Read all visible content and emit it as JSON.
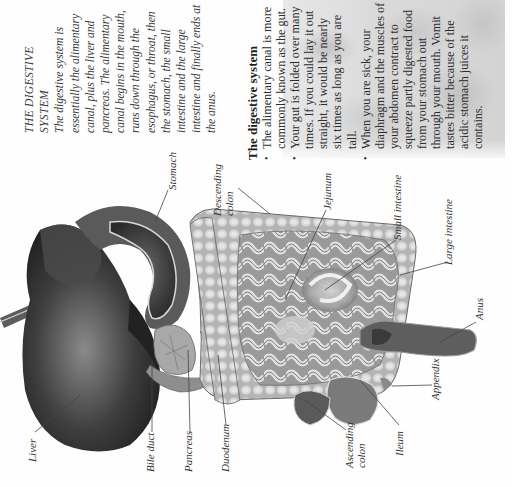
{
  "page": {
    "orientation": "rotated -90deg (text reads bottom-to-top)",
    "intro": {
      "title_line1": "THE DIGESTIVE",
      "title_line2": "SYSTEM",
      "body": "The digestive system is essentially the alimentary canal, plus the liver and pancreas. The alimentary canal begins in the mouth, runs down through the esophagus, or throat, then the stomach, the small intestine and the large intestine and finally ends at the anus."
    },
    "facts_box": {
      "heading": "The digestive system",
      "bullets": [
        "The alimentary canal is more commonly known as the gut.",
        "Your gut is folded over many times. If you could lay it out straight, it would be nearly six times as long as you are tall.",
        "When you are sick, your diaphragm and the muscles of your abdomen contract to squeeze partly digested food from your stomach out through your mouth. Vomit tastes bitter because of the acidic stomach juices it contains."
      ]
    },
    "illustration": {
      "subject": "digestive-system-anatomy",
      "labels": {
        "liver": "Liver",
        "bile_duct": "Bile duct",
        "pancreas": "Pancreas",
        "duodenum": "Duodenum",
        "stomach": "Stomach",
        "descending_colon": "Descending colon",
        "jejunum": "Jejunum",
        "small_intestine": "Small intestine",
        "large_intestine": "Large intestine",
        "anus": "Anus",
        "appendix": "Appendix",
        "ileum": "Ileum",
        "ascending_colon": "Ascending colon"
      }
    }
  }
}
